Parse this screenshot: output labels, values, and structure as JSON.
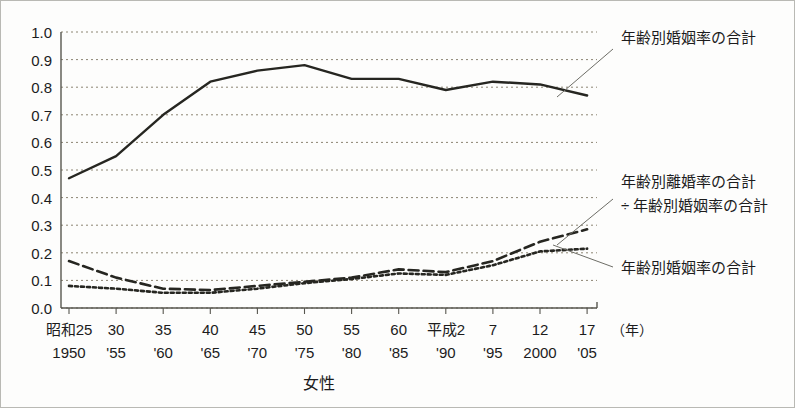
{
  "figure": {
    "axis_title": "女性",
    "unit_label": "（年）",
    "background_color": "#fdfdfc",
    "line_color": "#262621",
    "grid_color": "#8c8573"
  },
  "annotations": [
    {
      "id": "annotation-marriage-top",
      "lines": [
        "年齢別婚姻率の合計"
      ],
      "x": 620,
      "y": 42,
      "leader": {
        "x1": 612,
        "y1": 48,
        "x2": 556,
        "y2": 96
      }
    },
    {
      "id": "annotation-divorce-ratio",
      "lines": [
        "年齢別離婚率の合計",
        "÷ 年齢別婚姻率の合計"
      ],
      "x": 620,
      "y": 186,
      "leader": {
        "x1": 612,
        "y1": 198,
        "x2": 556,
        "y2": 244
      }
    },
    {
      "id": "annotation-marriage-bottom",
      "lines": [
        "年齢別婚姻率の合計"
      ],
      "x": 620,
      "y": 272,
      "leader": {
        "x1": 612,
        "y1": 266,
        "x2": 552,
        "y2": 244
      }
    }
  ],
  "chart_data": {
    "type": "line",
    "title": "",
    "xlabel": "女性",
    "ylabel": "",
    "ylim": [
      0.0,
      1.0
    ],
    "ytick_labels": [
      "1.0",
      "0.9",
      "0.8",
      "0.7",
      "0.6",
      "0.5",
      "0.4",
      "0.3",
      "0.2",
      "0.1",
      "0.0"
    ],
    "ytick_values": [
      1.0,
      0.9,
      0.8,
      0.7,
      0.6,
      0.5,
      0.4,
      0.3,
      0.2,
      0.1,
      0.0
    ],
    "grid": true,
    "legend_position": "annotations-right",
    "categories_era": [
      "昭和25",
      "30",
      "35",
      "40",
      "45",
      "50",
      "55",
      "60",
      "平成2",
      "7",
      "12",
      "17"
    ],
    "categories_western": [
      "1950",
      "'55",
      "'60",
      "'65",
      "'70",
      "'75",
      "'80",
      "'85",
      "'90",
      "'95",
      "2000",
      "'05"
    ],
    "x": [
      1950,
      1955,
      1960,
      1965,
      1970,
      1975,
      1980,
      1985,
      1990,
      1995,
      2000,
      2005
    ],
    "series": [
      {
        "name": "年齢別婚姻率の合計 (上)",
        "style": "solid",
        "stroke_width": 2.4,
        "values": [
          0.47,
          0.55,
          0.7,
          0.82,
          0.86,
          0.88,
          0.83,
          0.83,
          0.79,
          0.82,
          0.81,
          0.77
        ]
      },
      {
        "name": "年齢別離婚率の合計 ÷ 年齢別婚姻率の合計",
        "style": "dashed",
        "stroke_width": 2.6,
        "dash": "10 5",
        "values": [
          0.17,
          0.11,
          0.07,
          0.065,
          0.08,
          0.095,
          0.11,
          0.14,
          0.13,
          0.17,
          0.24,
          0.285
        ]
      },
      {
        "name": "年齢別婚姻率の合計 (下)",
        "style": "dotted",
        "stroke_width": 2.6,
        "dash": "3 3",
        "values": [
          0.08,
          0.07,
          0.055,
          0.055,
          0.07,
          0.09,
          0.105,
          0.125,
          0.12,
          0.155,
          0.205,
          0.215
        ]
      }
    ]
  }
}
